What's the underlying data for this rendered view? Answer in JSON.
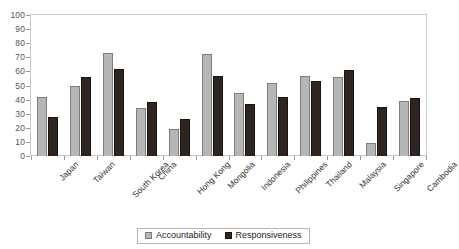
{
  "chart_data": {
    "type": "bar",
    "title": "",
    "subtitle": "",
    "xlabel": "",
    "ylabel": "",
    "ylim": [
      0,
      100
    ],
    "ytick_step": 10,
    "yticks": [
      0,
      10,
      20,
      30,
      40,
      50,
      60,
      70,
      80,
      90,
      100
    ],
    "grid": false,
    "legend_position": "bottom-center",
    "categories": [
      "Japan",
      "Taiwan",
      "South Korea",
      "China",
      "Hong Kong",
      "Mongolia",
      "Indonesia",
      "Philippines",
      "Thailand",
      "Malaysia",
      "Singapore",
      "Cambodia"
    ],
    "series": [
      {
        "name": "Accountability",
        "color": "#b6b6b6",
        "values": [
          42,
          50,
          73,
          34,
          19,
          72,
          45,
          52,
          57,
          56,
          9,
          39
        ]
      },
      {
        "name": "Responsiveness",
        "color": "#2e2520",
        "values": [
          28,
          56,
          62,
          38,
          26,
          57,
          37,
          42,
          53,
          61,
          35,
          41
        ]
      }
    ]
  },
  "legend": {
    "entries": [
      {
        "label": "Accountability"
      },
      {
        "label": "Responsiveness"
      }
    ]
  },
  "colors": {
    "accountability": "#b6b6b6",
    "responsiveness": "#2e2520",
    "axis": "#9a9a9a",
    "frame": "#c9c9c9",
    "tick_text": "#555555",
    "category_text": "#333333"
  }
}
